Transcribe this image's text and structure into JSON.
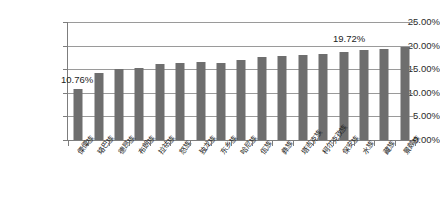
{
  "chart_data": {
    "type": "bar",
    "title": "",
    "subtitle": "",
    "xlabel": "",
    "ylabel": "",
    "ylim": [
      0,
      25
    ],
    "ytick_labels": [
      "0.00%",
      "5.00%",
      "10.00%",
      "15.00%",
      "20.00%",
      "25.00%"
    ],
    "ytick_values": [
      0,
      5,
      10,
      15,
      20,
      25
    ],
    "grid": true,
    "legend": "none",
    "series_name": "",
    "bar_color": "#6e6e6e",
    "categories": [
      "傈僳族",
      "珞巴族",
      "德昂族",
      "布朗族",
      "拉祜族",
      "怒族",
      "独龙族",
      "东乡族",
      "哈尼族",
      "佤族",
      "彝族",
      "塔吉克族",
      "柯尔克孜族",
      "保安族",
      "水族",
      "藏族",
      "景颇族"
    ],
    "values": [
      10.76,
      14.3,
      15.1,
      15.3,
      16.1,
      16.3,
      16.5,
      16.4,
      16.9,
      17.6,
      17.9,
      18.0,
      18.2,
      18.6,
      19.0,
      19.3,
      19.72
    ],
    "annotations": [
      {
        "name": "first-value-label",
        "text": "10.76%",
        "category": "傈僳族",
        "value": 10.76
      },
      {
        "name": "last-value-label",
        "text": "19.72%",
        "category": "景颇族",
        "value": 19.72
      }
    ]
  },
  "axis": {
    "y_tick_0": "0.00%",
    "y_tick_1": "5.00%",
    "y_tick_2": "10.00%",
    "y_tick_3": "15.00%",
    "y_tick_4": "20.00%",
    "y_tick_5": "25.00%"
  },
  "colors": {
    "bar": "#6e6e6e",
    "grid": "#9a9a9a",
    "axis": "#7d7d7d",
    "text": "#222222",
    "background": "#ffffff"
  }
}
